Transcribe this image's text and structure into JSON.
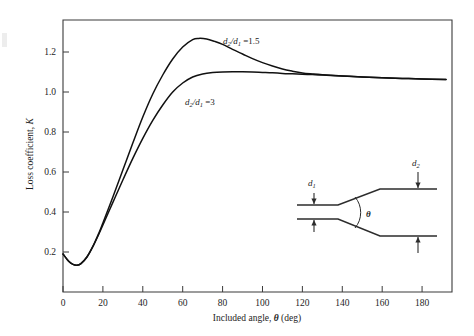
{
  "chart_data": {
    "type": "line",
    "title": "",
    "xlabel": "Included angle, θ (deg)",
    "ylabel": "Loss coefficient, K",
    "xlim": [
      0,
      195
    ],
    "ylim": [
      0,
      1.36
    ],
    "grid": false,
    "legend_position": "inline-annotation",
    "xticks": [
      0,
      20,
      40,
      60,
      80,
      100,
      120,
      140,
      160,
      180
    ],
    "xticklabels": [
      "0",
      "20",
      "40",
      "60",
      "80",
      "100",
      "120",
      "140",
      "160",
      "180"
    ],
    "yticks": [
      0.2,
      0.4,
      0.6,
      0.8,
      1.0,
      1.2
    ],
    "yticklabels": [
      "0.2",
      "0.4",
      "0.6",
      "0.8",
      "1.0",
      "1.2"
    ],
    "series": [
      {
        "name": "d2/d1 = 1.5",
        "label_text": "d2/d1 =1.5",
        "x": [
          0,
          3,
          5,
          7,
          9,
          12,
          15,
          18,
          20,
          25,
          30,
          35,
          40,
          45,
          50,
          55,
          60,
          65,
          68,
          72,
          76,
          80,
          85,
          90,
          95,
          100,
          105,
          110,
          115,
          120,
          125,
          130,
          140,
          150,
          160,
          170,
          180,
          192
        ],
        "y": [
          0.19,
          0.152,
          0.138,
          0.134,
          0.142,
          0.175,
          0.228,
          0.295,
          0.345,
          0.475,
          0.61,
          0.745,
          0.875,
          0.99,
          1.085,
          1.165,
          1.225,
          1.262,
          1.268,
          1.265,
          1.253,
          1.238,
          1.213,
          1.19,
          1.167,
          1.147,
          1.13,
          1.115,
          1.104,
          1.095,
          1.09,
          1.086,
          1.08,
          1.075,
          1.071,
          1.068,
          1.065,
          1.062
        ]
      },
      {
        "name": "d2/d1 = 3",
        "label_text": "d2/d1 =3",
        "x": [
          0,
          3,
          5,
          7,
          9,
          12,
          15,
          18,
          20,
          25,
          30,
          35,
          40,
          45,
          50,
          55,
          60,
          65,
          70,
          75,
          80,
          85,
          90,
          95,
          100,
          105,
          110,
          115,
          120,
          125,
          130,
          140,
          150,
          160,
          170,
          180,
          192
        ],
        "y": [
          0.19,
          0.152,
          0.138,
          0.134,
          0.142,
          0.175,
          0.228,
          0.29,
          0.335,
          0.448,
          0.56,
          0.668,
          0.768,
          0.858,
          0.935,
          1.0,
          1.045,
          1.075,
          1.09,
          1.097,
          1.1,
          1.101,
          1.101,
          1.1,
          1.098,
          1.096,
          1.093,
          1.091,
          1.089,
          1.087,
          1.085,
          1.08,
          1.075,
          1.071,
          1.068,
          1.065,
          1.062
        ]
      }
    ],
    "annotations": [
      {
        "name": "label-ratio-1p5",
        "text": "d2/d1 =1.5",
        "x": 78,
        "y": 1.29
      },
      {
        "name": "label-ratio-3",
        "text": "d2/d1 =3",
        "x": 47,
        "y": 0.98
      }
    ]
  },
  "axes": {
    "x": {
      "title_prefix": "Included angle, ",
      "title_symbol": "θ",
      "title_suffix": " (deg)",
      "labels": [
        "0",
        "20",
        "40",
        "60",
        "80",
        "100",
        "120",
        "140",
        "160",
        "180"
      ]
    },
    "y": {
      "title_prefix": "Loss coefficient, ",
      "title_symbol": "K",
      "labels": [
        "0.2",
        "0.4",
        "0.6",
        "0.8",
        "1.0",
        "1.2"
      ]
    }
  },
  "curve_labels": {
    "upper": {
      "num": "d",
      "num_sub": "2",
      "den": "d",
      "den_sub": "1",
      "value": "=1.5"
    },
    "lower": {
      "num": "d",
      "num_sub": "2",
      "den": "d",
      "den_sub": "1",
      "value": "=3"
    }
  },
  "inset_diagram": {
    "name": "diffuser-schematic",
    "d1_label": "d",
    "d1_sub": "1",
    "d2_label": "d",
    "d2_sub": "2",
    "theta_label": "θ"
  },
  "colors": {
    "curve": "#111111",
    "axis": "#3b3b3b",
    "diagram": "#2c2c2c",
    "text": "#1c1c1c",
    "background": "#ffffff"
  }
}
